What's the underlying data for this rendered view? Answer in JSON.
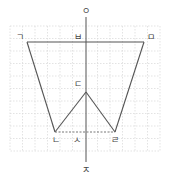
{
  "diagram": {
    "type": "geometry-figure",
    "colors": {
      "background": "#ffffff",
      "grid": "#d8d8d8",
      "line": "#555555",
      "label": "#444444"
    },
    "grid": {
      "x": 10,
      "y": 26,
      "width": 150,
      "height": 125,
      "cell": 12.5
    },
    "axis": {
      "x": 86,
      "y1": 17,
      "y2": 162
    },
    "labels": {
      "top": "ㅇ",
      "bottom": "ㅈ",
      "topLeft": "ㄱ",
      "topMid": "ㅂ",
      "topRight": "ㅁ",
      "apex": "ㄷ",
      "bottomLeft": "ㄴ",
      "bottomMid": "ㅅ",
      "bottomRight": "ㄹ"
    },
    "points": {
      "ㄱ": [
        27,
        42
      ],
      "ㅁ": [
        144,
        42
      ],
      "ㅂ": [
        86,
        42
      ],
      "ㄷ": [
        86,
        92
      ],
      "ㄴ": [
        55,
        132
      ],
      "ㄹ": [
        115,
        132
      ],
      "ㅅ": [
        86,
        132
      ]
    }
  }
}
